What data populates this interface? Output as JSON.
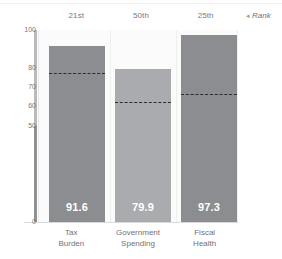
{
  "legend": {
    "marker": "◂",
    "label": "Rank"
  },
  "chart_data": {
    "type": "bar",
    "title": "",
    "subtitle": "",
    "xlabel": "",
    "ylabel": "",
    "ylim": [
      0,
      100
    ],
    "yticks": [
      0,
      50,
      60,
      70,
      80,
      100
    ],
    "ytick_labels": [
      "0",
      "50",
      "60",
      "70",
      "80",
      "100"
    ],
    "grid": false,
    "legend_position": "top-right",
    "categories": [
      "Tax Burden",
      "Government Spending",
      "Fiscal Health"
    ],
    "category_lines": [
      [
        "Tax",
        "Burden"
      ],
      [
        "Government",
        "Spending"
      ],
      [
        "Fiscal",
        "Health"
      ]
    ],
    "series": [
      {
        "name": "Score",
        "values": [
          91.6,
          79.9,
          97.3
        ],
        "value_labels": [
          "91.6",
          "79.9",
          "97.3"
        ],
        "colors": [
          "#8b8d90",
          "#a9abae",
          "#8b8d90"
        ]
      },
      {
        "name": "Rank",
        "style": "dashed-line",
        "color": "#2a2c2f",
        "values": [
          77,
          62,
          66
        ],
        "rank_labels": [
          "21st",
          "50th",
          "25th"
        ]
      }
    ]
  }
}
